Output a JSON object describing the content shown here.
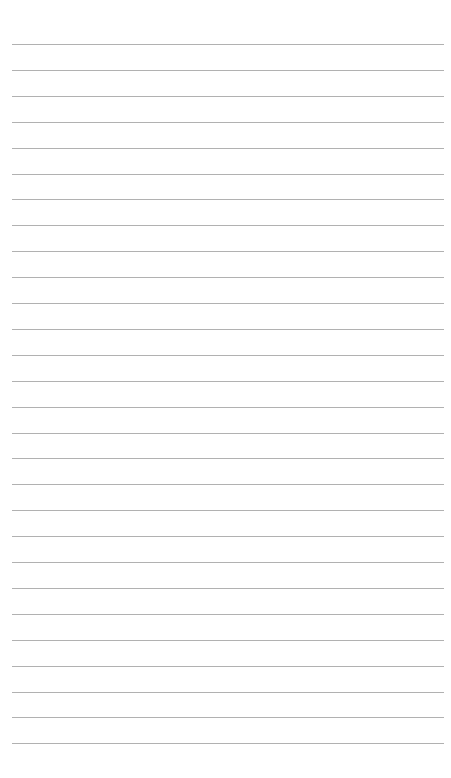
{
  "page": {
    "type": "lined-paper",
    "background_color": "#ffffff",
    "rule_color": "#a9a9a9",
    "rule_count": 28,
    "first_rule_y": 44,
    "rule_spacing": 25.9,
    "rule_left": 12,
    "rule_right": 444
  }
}
